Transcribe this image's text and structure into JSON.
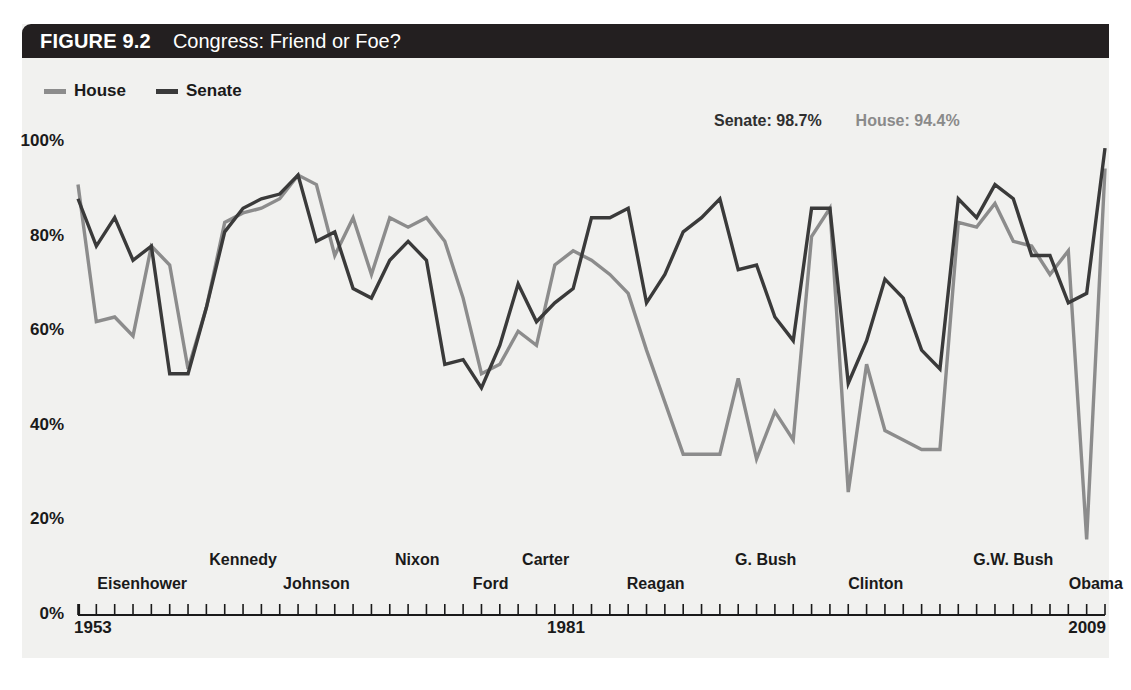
{
  "figure": {
    "number": "FIGURE 9.2",
    "title": "Congress: Friend or Foe?"
  },
  "legend": {
    "items": [
      {
        "label": "House",
        "color": "#8c8c8c"
      },
      {
        "label": "Senate",
        "color": "#3a3a3a"
      }
    ]
  },
  "annotations": {
    "senate": "Senate: 98.7%",
    "house": "House: 94.4%"
  },
  "axis": {
    "y_ticks": [
      "100%",
      "80%",
      "60%",
      "40%",
      "20%",
      "0%"
    ],
    "year_start": "1953",
    "year_mid": "1981",
    "year_end": "2009"
  },
  "presidents": [
    {
      "name": "Eisenhower",
      "row": 1,
      "center_year": 1956.5
    },
    {
      "name": "Kennedy",
      "row": 0,
      "center_year": 1962.0
    },
    {
      "name": "Johnson",
      "row": 1,
      "center_year": 1966.0
    },
    {
      "name": "Nixon",
      "row": 0,
      "center_year": 1971.5
    },
    {
      "name": "Ford",
      "row": 1,
      "center_year": 1975.5
    },
    {
      "name": "Carter",
      "row": 0,
      "center_year": 1978.5
    },
    {
      "name": "Reagan",
      "row": 1,
      "center_year": 1984.5
    },
    {
      "name": "G. Bush",
      "row": 0,
      "center_year": 1990.5
    },
    {
      "name": "Clinton",
      "row": 1,
      "center_year": 1996.5
    },
    {
      "name": "G.W. Bush",
      "row": 0,
      "center_year": 2004.0
    },
    {
      "name": "Obama",
      "row": 1,
      "center_year": 2008.5
    }
  ],
  "chart_data": {
    "type": "line",
    "title": "Congress: Friend or Foe?",
    "xlabel": "",
    "ylabel": "",
    "xlim": [
      1953,
      2009
    ],
    "ylim": [
      0,
      100
    ],
    "grid": false,
    "legend_position": "top-left",
    "x": [
      1953,
      1954,
      1955,
      1956,
      1957,
      1958,
      1959,
      1960,
      1961,
      1962,
      1963,
      1964,
      1965,
      1966,
      1967,
      1968,
      1969,
      1970,
      1971,
      1972,
      1973,
      1974,
      1975,
      1976,
      1977,
      1978,
      1979,
      1980,
      1981,
      1982,
      1983,
      1984,
      1985,
      1986,
      1987,
      1988,
      1989,
      1990,
      1991,
      1992,
      1993,
      1994,
      1995,
      1996,
      1997,
      1998,
      1999,
      2000,
      2001,
      2002,
      2003,
      2004,
      2005,
      2006,
      2007,
      2008,
      2009
    ],
    "series": [
      {
        "name": "House",
        "color": "#8c8c8c",
        "values": [
          91,
          62,
          63,
          59,
          78,
          74,
          52,
          65,
          83,
          85,
          86,
          88,
          93,
          91,
          76,
          84,
          72,
          84,
          82,
          84,
          79,
          67,
          51,
          53,
          60,
          57,
          74,
          77,
          75,
          72,
          68,
          56,
          45,
          34,
          34,
          34,
          50,
          33,
          43,
          37,
          80,
          86,
          26,
          53,
          39,
          37,
          35,
          35,
          83,
          82,
          87,
          79,
          78,
          72,
          77,
          16,
          94.4
        ]
      },
      {
        "name": "Senate",
        "color": "#3a3a3a",
        "values": [
          88,
          78,
          84,
          75,
          78,
          51,
          51,
          65,
          81,
          86,
          88,
          89,
          93,
          79,
          81,
          69,
          67,
          75,
          79,
          75,
          53,
          54,
          48,
          57,
          70,
          62,
          66,
          69,
          84,
          84,
          86,
          66,
          72,
          81,
          84,
          88,
          73,
          74,
          63,
          58,
          86,
          86,
          49,
          58,
          71,
          67,
          56,
          52,
          88,
          84,
          91,
          88,
          76,
          76,
          66,
          68,
          98.7
        ]
      }
    ]
  }
}
